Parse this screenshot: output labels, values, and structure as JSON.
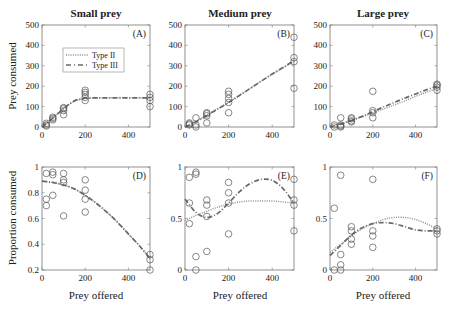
{
  "figure": {
    "col_titles": [
      "Small prey",
      "Medium prey",
      "Large prey"
    ],
    "row_ylabels": [
      "Prey consumed",
      "Proportion consumed"
    ],
    "xlabel": "Prey offered",
    "legend": {
      "type2_label": "Type II",
      "type3_label": "Type III"
    },
    "colors": {
      "type2": "#8a8a8a",
      "type3": "#6a6a6a",
      "axes": "#777777",
      "markers": "#555555"
    }
  },
  "chart_data": [
    {
      "panel": "(A)",
      "title": "Small prey",
      "type": "scatter",
      "ylabel": "Prey consumed",
      "xlabel": "",
      "xlim": [
        0,
        500
      ],
      "ylim": [
        0,
        500
      ],
      "xticks": [
        0,
        200,
        400
      ],
      "yticks": [
        0,
        100,
        200,
        300,
        400,
        500
      ],
      "points": [
        [
          20,
          5
        ],
        [
          20,
          10
        ],
        [
          20,
          18
        ],
        [
          50,
          35
        ],
        [
          50,
          42
        ],
        [
          50,
          48
        ],
        [
          100,
          60
        ],
        [
          100,
          80
        ],
        [
          100,
          90
        ],
        [
          100,
          95
        ],
        [
          200,
          130
        ],
        [
          200,
          145
        ],
        [
          200,
          160
        ],
        [
          200,
          170
        ],
        [
          200,
          180
        ],
        [
          500,
          100
        ],
        [
          500,
          130
        ],
        [
          500,
          145
        ],
        [
          500,
          160
        ]
      ],
      "series": [
        {
          "name": "Type II",
          "x": [
            0,
            25,
            50,
            75,
            100,
            125,
            150,
            175,
            200,
            250,
            300,
            350,
            400,
            450,
            500
          ],
          "y": [
            0,
            22,
            45,
            68,
            90,
            110,
            125,
            135,
            140,
            142,
            143,
            143,
            143,
            143,
            143
          ]
        },
        {
          "name": "Type III",
          "x": [
            0,
            25,
            50,
            75,
            100,
            125,
            150,
            175,
            200,
            250,
            300,
            350,
            400,
            450,
            500
          ],
          "y": [
            0,
            20,
            43,
            67,
            90,
            112,
            128,
            137,
            141,
            143,
            143,
            143,
            143,
            143,
            143
          ]
        }
      ]
    },
    {
      "panel": "(B)",
      "title": "Medium prey",
      "type": "scatter",
      "ylabel": "",
      "xlabel": "",
      "xlim": [
        0,
        500
      ],
      "ylim": [
        0,
        500
      ],
      "xticks": [
        0,
        200,
        400
      ],
      "yticks": [
        0,
        100,
        200,
        300,
        400,
        500
      ],
      "points": [
        [
          20,
          10
        ],
        [
          20,
          15
        ],
        [
          20,
          20
        ],
        [
          50,
          0
        ],
        [
          50,
          10
        ],
        [
          50,
          45
        ],
        [
          100,
          20
        ],
        [
          100,
          55
        ],
        [
          100,
          65
        ],
        [
          100,
          70
        ],
        [
          200,
          70
        ],
        [
          200,
          120
        ],
        [
          200,
          140
        ],
        [
          200,
          160
        ],
        [
          200,
          175
        ],
        [
          500,
          190
        ],
        [
          500,
          320
        ],
        [
          500,
          340
        ],
        [
          500,
          440
        ]
      ],
      "series": [
        {
          "name": "Type II",
          "x": [
            0,
            50,
            100,
            150,
            200,
            250,
            300,
            350,
            400,
            450,
            500
          ],
          "y": [
            0,
            28,
            58,
            90,
            120,
            155,
            190,
            225,
            258,
            290,
            320
          ]
        },
        {
          "name": "Type III",
          "x": [
            0,
            50,
            100,
            150,
            200,
            250,
            300,
            350,
            400,
            450,
            500
          ],
          "y": [
            0,
            25,
            56,
            88,
            120,
            155,
            190,
            225,
            260,
            292,
            325
          ]
        }
      ]
    },
    {
      "panel": "(C)",
      "title": "Large prey",
      "type": "scatter",
      "ylabel": "",
      "xlabel": "",
      "xlim": [
        0,
        500
      ],
      "ylim": [
        0,
        500
      ],
      "xticks": [
        0,
        200,
        400
      ],
      "yticks": [
        0,
        100,
        200,
        300,
        400,
        500
      ],
      "points": [
        [
          20,
          0
        ],
        [
          20,
          10
        ],
        [
          50,
          0
        ],
        [
          50,
          5
        ],
        [
          50,
          10
        ],
        [
          50,
          45
        ],
        [
          100,
          25
        ],
        [
          100,
          30
        ],
        [
          100,
          40
        ],
        [
          100,
          45
        ],
        [
          200,
          45
        ],
        [
          200,
          70
        ],
        [
          200,
          80
        ],
        [
          200,
          175
        ],
        [
          500,
          180
        ],
        [
          500,
          195
        ],
        [
          500,
          205
        ],
        [
          500,
          210
        ]
      ],
      "series": [
        {
          "name": "Type II",
          "x": [
            0,
            50,
            100,
            150,
            200,
            250,
            300,
            350,
            400,
            450,
            500
          ],
          "y": [
            0,
            15,
            32,
            50,
            68,
            88,
            108,
            128,
            150,
            170,
            190
          ]
        },
        {
          "name": "Type III",
          "x": [
            0,
            50,
            100,
            150,
            200,
            250,
            300,
            350,
            400,
            450,
            500
          ],
          "y": [
            0,
            14,
            32,
            52,
            75,
            98,
            120,
            142,
            162,
            182,
            200
          ]
        }
      ]
    },
    {
      "panel": "(D)",
      "title": "",
      "type": "scatter",
      "ylabel": "Proportion consumed",
      "xlabel": "Prey offered",
      "xlim": [
        0,
        500
      ],
      "ylim": [
        0.2,
        1.0
      ],
      "xticks": [
        0,
        200,
        400
      ],
      "yticks": [
        0.2,
        0.4,
        0.6,
        0.8,
        1.0
      ],
      "points": [
        [
          20,
          0.7
        ],
        [
          20,
          0.75
        ],
        [
          20,
          0.95
        ],
        [
          50,
          0.78
        ],
        [
          50,
          0.94
        ],
        [
          50,
          0.96
        ],
        [
          100,
          0.62
        ],
        [
          100,
          0.88
        ],
        [
          100,
          0.9
        ],
        [
          100,
          0.95
        ],
        [
          200,
          0.65
        ],
        [
          200,
          0.75
        ],
        [
          200,
          0.82
        ],
        [
          200,
          0.9
        ],
        [
          500,
          0.2
        ],
        [
          500,
          0.28
        ],
        [
          500,
          0.32
        ]
      ],
      "series": [
        {
          "name": "Type II",
          "x": [
            0,
            50,
            100,
            150,
            200,
            250,
            300,
            350,
            400,
            450,
            500
          ],
          "y": [
            0.89,
            0.88,
            0.86,
            0.83,
            0.78,
            0.72,
            0.65,
            0.57,
            0.48,
            0.39,
            0.29
          ]
        },
        {
          "name": "Type III",
          "x": [
            0,
            50,
            100,
            150,
            200,
            250,
            300,
            350,
            400,
            450,
            500
          ],
          "y": [
            0.89,
            0.88,
            0.86,
            0.83,
            0.78,
            0.72,
            0.65,
            0.57,
            0.48,
            0.39,
            0.29
          ]
        }
      ]
    },
    {
      "panel": "(E)",
      "title": "",
      "type": "scatter",
      "ylabel": "",
      "xlabel": "Prey offered",
      "xlim": [
        0,
        500
      ],
      "ylim": [
        0,
        1
      ],
      "xticks": [
        0,
        200,
        400
      ],
      "yticks": [
        0,
        0.5,
        1
      ],
      "points": [
        [
          20,
          0.45
        ],
        [
          20,
          0.65
        ],
        [
          20,
          0.9
        ],
        [
          50,
          0.0
        ],
        [
          50,
          0.13
        ],
        [
          50,
          0.93
        ],
        [
          50,
          0.95
        ],
        [
          100,
          0.18
        ],
        [
          100,
          0.52
        ],
        [
          100,
          0.63
        ],
        [
          100,
          0.68
        ],
        [
          200,
          0.35
        ],
        [
          200,
          0.65
        ],
        [
          200,
          0.75
        ],
        [
          200,
          0.85
        ],
        [
          500,
          0.38
        ],
        [
          500,
          0.63
        ],
        [
          500,
          0.68
        ],
        [
          500,
          0.88
        ]
      ],
      "series": [
        {
          "name": "Type II",
          "x": [
            0,
            50,
            100,
            150,
            200,
            250,
            300,
            350,
            400,
            450,
            500
          ],
          "y": [
            0.48,
            0.53,
            0.57,
            0.61,
            0.64,
            0.66,
            0.67,
            0.67,
            0.67,
            0.66,
            0.65
          ]
        },
        {
          "name": "Type III",
          "x": [
            0,
            50,
            100,
            150,
            200,
            250,
            300,
            350,
            400,
            450,
            500
          ],
          "y": [
            0.69,
            0.56,
            0.51,
            0.55,
            0.65,
            0.76,
            0.84,
            0.88,
            0.87,
            0.79,
            0.65
          ]
        }
      ]
    },
    {
      "panel": "(F)",
      "title": "",
      "type": "scatter",
      "ylabel": "",
      "xlabel": "Prey offered",
      "xlim": [
        0,
        500
      ],
      "ylim": [
        0,
        1
      ],
      "xticks": [
        0,
        200,
        400
      ],
      "yticks": [
        0,
        0.5,
        1
      ],
      "points": [
        [
          20,
          0.0
        ],
        [
          20,
          0.6
        ],
        [
          50,
          0.0
        ],
        [
          50,
          0.05
        ],
        [
          50,
          0.15
        ],
        [
          50,
          0.92
        ],
        [
          100,
          0.25
        ],
        [
          100,
          0.3
        ],
        [
          100,
          0.38
        ],
        [
          100,
          0.42
        ],
        [
          200,
          0.22
        ],
        [
          200,
          0.33
        ],
        [
          200,
          0.38
        ],
        [
          200,
          0.88
        ],
        [
          500,
          0.35
        ],
        [
          500,
          0.38
        ],
        [
          500,
          0.4
        ]
      ],
      "series": [
        {
          "name": "Type II",
          "x": [
            0,
            50,
            100,
            150,
            200,
            250,
            300,
            350,
            400,
            450,
            500
          ],
          "y": [
            0.17,
            0.25,
            0.33,
            0.4,
            0.45,
            0.49,
            0.51,
            0.51,
            0.49,
            0.45,
            0.4
          ]
        },
        {
          "name": "Type III",
          "x": [
            0,
            50,
            100,
            150,
            200,
            250,
            300,
            350,
            400,
            450,
            500
          ],
          "y": [
            0.14,
            0.24,
            0.34,
            0.41,
            0.45,
            0.46,
            0.45,
            0.42,
            0.39,
            0.38,
            0.38
          ]
        }
      ]
    }
  ]
}
